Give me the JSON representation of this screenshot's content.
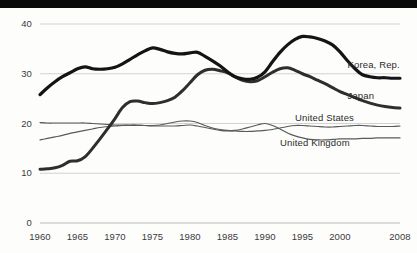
{
  "chart_data": {
    "type": "line",
    "title": "",
    "subtitle": "",
    "xlabel": "",
    "ylabel": "",
    "xlim": [
      1960,
      2008
    ],
    "ylim": [
      0,
      40
    ],
    "grid": true,
    "gridlines_y": [
      10,
      20,
      30,
      40
    ],
    "axis_baseline_y": 0,
    "legend_position": "right-inline",
    "yticks": [
      "0",
      "10",
      "20",
      "30",
      "40"
    ],
    "ytick_values": [
      0,
      10,
      20,
      30,
      40
    ],
    "xticks": [
      "1960",
      "1965",
      "1970",
      "1975",
      "1980",
      "1985",
      "1990",
      "1995",
      "2000",
      "2008"
    ],
    "xtick_values": [
      1960,
      1965,
      1970,
      1975,
      1980,
      1985,
      1990,
      1995,
      2000,
      2008
    ],
    "series": [
      {
        "name": "Korea, Rep.",
        "color": "#141414",
        "width": 3.2,
        "label_x": 2001,
        "label_y": 31.7,
        "x": [
          1960,
          1961,
          1962,
          1963,
          1964,
          1965,
          1966,
          1967,
          1968,
          1969,
          1970,
          1971,
          1972,
          1973,
          1974,
          1975,
          1976,
          1977,
          1978,
          1979,
          1980,
          1981,
          1982,
          1983,
          1984,
          1985,
          1986,
          1987,
          1988,
          1989,
          1990,
          1991,
          1992,
          1993,
          1994,
          1995,
          1996,
          1997,
          1998,
          1999,
          2000,
          2001,
          2002,
          2003,
          2004,
          2005,
          2006,
          2007,
          2008
        ],
        "y": [
          25.8,
          27.2,
          28.4,
          29.4,
          30.2,
          31.0,
          31.4,
          31.0,
          30.9,
          31.0,
          31.3,
          32.0,
          32.9,
          33.8,
          34.6,
          35.2,
          34.9,
          34.4,
          34.1,
          34.0,
          34.2,
          34.3,
          33.5,
          32.6,
          31.6,
          30.4,
          29.4,
          29.0,
          28.9,
          29.3,
          30.4,
          32.4,
          34.3,
          35.8,
          36.9,
          37.5,
          37.4,
          37.1,
          36.6,
          35.8,
          34.4,
          32.6,
          31.0,
          29.8,
          29.4,
          29.2,
          29.2,
          29.1,
          29.1
        ]
      },
      {
        "name": "Japan",
        "color": "#2e2e2e",
        "width": 3.0,
        "label_x": 2001,
        "label_y": 25.6,
        "x": [
          1960,
          1961,
          1962,
          1963,
          1964,
          1965,
          1966,
          1967,
          1968,
          1969,
          1970,
          1971,
          1972,
          1973,
          1974,
          1975,
          1976,
          1977,
          1978,
          1979,
          1980,
          1981,
          1982,
          1983,
          1984,
          1985,
          1986,
          1987,
          1988,
          1989,
          1990,
          1991,
          1992,
          1993,
          1994,
          1995,
          1996,
          1997,
          1998,
          1999,
          2000,
          2001,
          2002,
          2003,
          2004,
          2005,
          2006,
          2007,
          2008
        ],
        "y": [
          10.8,
          10.9,
          11.1,
          11.6,
          12.4,
          12.5,
          13.3,
          15.0,
          16.9,
          18.9,
          21.0,
          23.2,
          24.4,
          24.5,
          24.2,
          24.0,
          24.2,
          24.6,
          25.3,
          26.6,
          28.2,
          29.8,
          30.7,
          30.9,
          30.6,
          30.2,
          29.4,
          28.7,
          28.4,
          28.6,
          29.4,
          30.3,
          31.0,
          31.2,
          30.7,
          30.0,
          29.4,
          28.7,
          28.0,
          27.2,
          26.4,
          25.8,
          25.2,
          24.6,
          24.1,
          23.7,
          23.4,
          23.2,
          23.1
        ]
      },
      {
        "name": "United States",
        "color": "#5a5a5a",
        "width": 1.2,
        "label_x": 1994,
        "label_y": 21.2,
        "x": [
          1960,
          1961,
          1962,
          1963,
          1964,
          1965,
          1966,
          1967,
          1968,
          1969,
          1970,
          1971,
          1972,
          1973,
          1974,
          1975,
          1976,
          1977,
          1978,
          1979,
          1980,
          1981,
          1982,
          1983,
          1984,
          1985,
          1986,
          1987,
          1988,
          1989,
          1990,
          1991,
          1992,
          1993,
          1994,
          1995,
          1996,
          1997,
          1998,
          1999,
          2000,
          2001,
          2002,
          2003,
          2004,
          2005,
          2006,
          2007,
          2008
        ],
        "y": [
          20.2,
          20.1,
          20.1,
          20.1,
          20.1,
          20.1,
          20.1,
          20.0,
          19.9,
          19.8,
          19.7,
          19.7,
          19.7,
          19.7,
          19.6,
          19.6,
          19.7,
          20.0,
          20.3,
          20.5,
          20.5,
          20.2,
          19.6,
          19.1,
          18.8,
          18.6,
          18.5,
          18.4,
          18.4,
          18.5,
          18.6,
          18.8,
          19.1,
          19.4,
          19.6,
          19.6,
          19.5,
          19.4,
          19.3,
          19.3,
          19.4,
          19.5,
          19.6,
          19.6,
          19.5,
          19.4,
          19.4,
          19.4,
          19.5
        ]
      },
      {
        "name": "United Kingdom",
        "color": "#5a5a5a",
        "width": 1.2,
        "label_x": 1992,
        "label_y": 16.0,
        "x": [
          1960,
          1961,
          1962,
          1963,
          1964,
          1965,
          1966,
          1967,
          1968,
          1969,
          1970,
          1971,
          1972,
          1973,
          1974,
          1975,
          1976,
          1977,
          1978,
          1979,
          1980,
          1981,
          1982,
          1983,
          1984,
          1985,
          1986,
          1987,
          1988,
          1989,
          1990,
          1991,
          1992,
          1993,
          1994,
          1995,
          1996,
          1997,
          1998,
          1999,
          2000,
          2001,
          2002,
          2003,
          2004,
          2005,
          2006,
          2007,
          2008
        ],
        "y": [
          16.7,
          17.0,
          17.3,
          17.6,
          18.0,
          18.3,
          18.6,
          18.9,
          19.2,
          19.4,
          19.5,
          19.6,
          19.6,
          19.6,
          19.6,
          19.5,
          19.5,
          19.5,
          19.5,
          19.6,
          19.7,
          19.5,
          19.2,
          18.9,
          18.6,
          18.5,
          18.6,
          18.9,
          19.3,
          19.7,
          20.0,
          19.6,
          18.9,
          18.1,
          17.5,
          17.1,
          16.8,
          16.7,
          16.7,
          16.8,
          16.9,
          16.9,
          16.9,
          17.0,
          17.0,
          17.1,
          17.1,
          17.1,
          17.1
        ]
      }
    ]
  }
}
